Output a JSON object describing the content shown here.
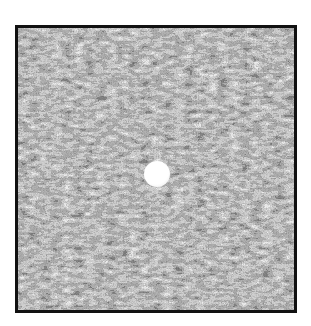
{
  "image": {
    "subject": "golf ball in grass",
    "style": "grayscale halftone photograph with black border",
    "frame": {
      "border_color": "#111111",
      "background": "#ffffff"
    },
    "ball": {
      "cx": 139,
      "cy": 146,
      "r": 13,
      "color": "#ffffff"
    }
  }
}
